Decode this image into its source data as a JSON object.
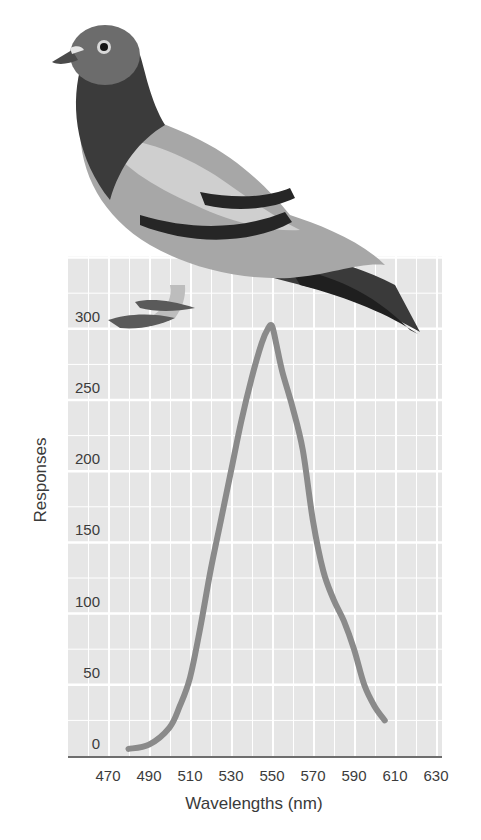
{
  "chart_data": {
    "type": "line",
    "title": "",
    "xlabel": "Wavelengths (nm)",
    "ylabel": "Responses",
    "x_ticks": [
      470,
      490,
      510,
      530,
      550,
      570,
      590,
      610,
      630
    ],
    "y_ticks": [
      0,
      50,
      100,
      150,
      200,
      250,
      300
    ],
    "xlim": [
      460,
      640
    ],
    "ylim": [
      0,
      350
    ],
    "grid": true,
    "legend": null,
    "series": [
      {
        "name": "Pigeon pecking responses",
        "x": [
          480,
          490,
          500,
          505,
          510,
          515,
          520,
          525,
          530,
          535,
          540,
          545,
          548,
          550,
          552,
          555,
          560,
          565,
          570,
          575,
          580,
          585,
          590,
          595,
          600,
          605
        ],
        "y": [
          5,
          8,
          20,
          35,
          55,
          90,
          130,
          165,
          200,
          235,
          265,
          290,
          300,
          302,
          290,
          270,
          245,
          215,
          165,
          130,
          110,
          95,
          75,
          50,
          35,
          25
        ]
      }
    ],
    "annotations": [
      "Illustration of a pigeon perched on top of the chart"
    ]
  },
  "colors": {
    "plot_bg": "#e6e6e6",
    "grid": "#ffffff",
    "curve": "#8a8a8a",
    "axis": "#6e6e6e",
    "text": "#3a3a3a"
  }
}
